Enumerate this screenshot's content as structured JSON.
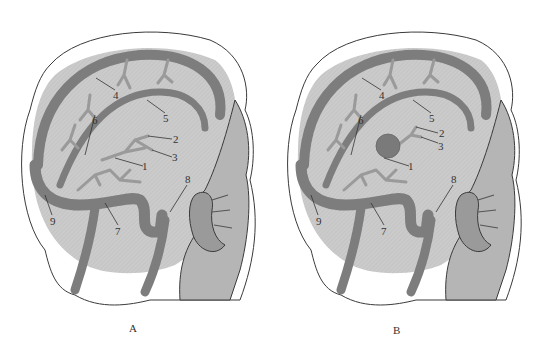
{
  "figure": {
    "colors": {
      "vessel": "#7d7d7d",
      "vessel_dark": "#5f5f5f",
      "brain": "#c9c9c9",
      "skin_outline": "#3a3a3a",
      "face_shade": "#a8a8a8",
      "label": "#333333"
    },
    "panels": [
      {
        "caption": "A",
        "has_aneurysm": false,
        "labels": [
          "1",
          "2",
          "3",
          "4",
          "5",
          "6",
          "7",
          "8",
          "9"
        ]
      },
      {
        "caption": "B",
        "has_aneurysm": true,
        "labels": [
          "1",
          "2",
          "3",
          "4",
          "5",
          "6",
          "7",
          "8",
          "9"
        ]
      }
    ]
  }
}
